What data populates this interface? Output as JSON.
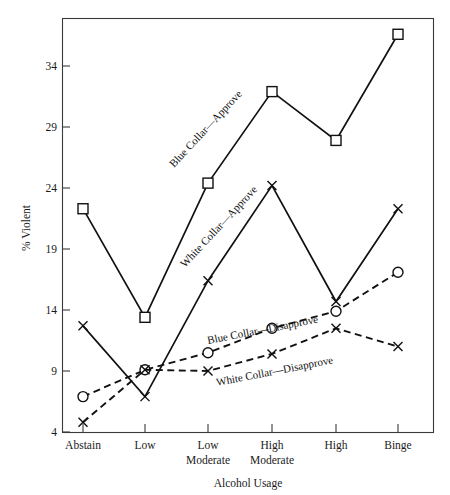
{
  "chart_data": {
    "type": "line",
    "title": "",
    "xlabel": "Alcohol Usage",
    "ylabel": "% Violent",
    "categories": [
      "Abstain",
      "Low",
      "Low Moderate",
      "High Moderate",
      "High",
      "Binge"
    ],
    "category_lines": [
      [
        "Abstain",
        ""
      ],
      [
        "Low",
        ""
      ],
      [
        "Low",
        "Moderate"
      ],
      [
        "High",
        "Moderate"
      ],
      [
        "High",
        ""
      ],
      [
        "Binge",
        ""
      ]
    ],
    "yticks": [
      4,
      9,
      14,
      19,
      24,
      29,
      34
    ],
    "ytick_labels": [
      "4",
      "9",
      "14",
      "19",
      "24",
      "29",
      "34"
    ],
    "ylim": [
      4,
      38
    ],
    "xlim": [
      0,
      7
    ],
    "grid": false,
    "legend_position": "inline-annotations",
    "series": [
      {
        "name": "Blue Collar—Approve",
        "marker": "square",
        "line_style": "solid",
        "color": "#111111",
        "values": [
          22.3,
          13.4,
          24.4,
          31.9,
          27.9,
          36.6
        ]
      },
      {
        "name": "White Collar—Approve",
        "marker": "cross",
        "line_style": "solid",
        "color": "#111111",
        "values": [
          12.7,
          6.9,
          16.4,
          24.2,
          14.7,
          22.3
        ]
      },
      {
        "name": "Blue Collar—Disapprove",
        "marker": "circle",
        "line_style": "dashed",
        "color": "#111111",
        "values": [
          6.9,
          9.1,
          10.5,
          12.5,
          13.9,
          17.1
        ]
      },
      {
        "name": "White Collar—Disapprove",
        "marker": "cross",
        "line_style": "dashed",
        "color": "#111111",
        "values": [
          4.8,
          9.1,
          9.0,
          10.4,
          12.5,
          11.0
        ]
      }
    ],
    "annotations": [
      {
        "text": "Blue Collar—Approve",
        "x": 174,
        "y": 168,
        "rotate": -47
      },
      {
        "text": "White Collar—Approve",
        "x": 185,
        "y": 268,
        "rotate": -47
      },
      {
        "text": "Blue Collar—Disapprove",
        "x": 208,
        "y": 344,
        "rotate": -11
      },
      {
        "text": "White Collar—Disapprove",
        "x": 217,
        "y": 386,
        "rotate": -11
      }
    ]
  }
}
